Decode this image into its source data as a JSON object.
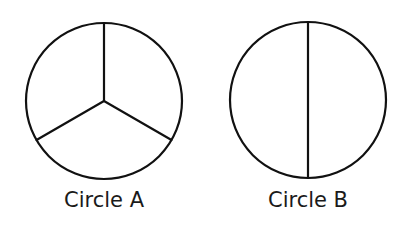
{
  "figures": [
    {
      "label": "Circle A",
      "center": [
        104,
        101
      ],
      "radius": 78,
      "parts": 3,
      "divider": "three radii at 120° (top, lower-left, lower-right)"
    },
    {
      "label": "Circle B",
      "center": [
        308,
        100
      ],
      "radius": 78,
      "parts": 2,
      "divider": "vertical diameter"
    }
  ],
  "style": {
    "stroke": "#111111",
    "background": "#ffffff"
  }
}
